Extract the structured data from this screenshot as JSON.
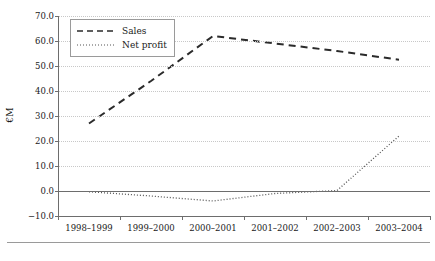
{
  "chart_data": {
    "type": "line",
    "title": "",
    "xlabel": "",
    "ylabel": "€M",
    "categories": [
      "1998–1999",
      "1999–2000",
      "2000–2001",
      "2001–2002",
      "2002–2003",
      "2003–2004"
    ],
    "series": [
      {
        "name": "Sales",
        "values": [
          27.0,
          44.0,
          62.0,
          59.0,
          56.0,
          52.5
        ],
        "style": "dashed",
        "color": "#2b2b2b"
      },
      {
        "name": "Net profit",
        "values": [
          -0.3,
          -2.0,
          -4.0,
          -1.0,
          0.2,
          22.0
        ],
        "style": "dotted",
        "color": "#555555"
      }
    ],
    "ylim": [
      -10.0,
      70.0
    ],
    "ytick_values": [
      -10.0,
      0.0,
      10.0,
      20.0,
      30.0,
      40.0,
      50.0,
      60.0,
      70.0
    ],
    "ytick_labels": [
      "−10.0",
      "0.0",
      "10.0",
      "20.0",
      "30.0",
      "40.0",
      "50.0",
      "60.0",
      "70.0"
    ],
    "grid": true,
    "grid_axis": "y",
    "legend_position": "top-left",
    "legend_entries": [
      "Sales",
      "Net profit"
    ],
    "axis_color": "#6d6d6d",
    "grid_color": "#c8c8c8",
    "background": "#ffffff"
  }
}
